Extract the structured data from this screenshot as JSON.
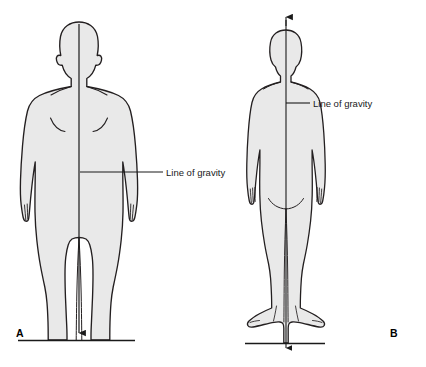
{
  "figure": {
    "background_color": "#ffffff",
    "body_fill_color": "#e9e9e9",
    "outline_color": "#231f20",
    "line_color": "#1a1a1a",
    "width": 426,
    "height": 367
  },
  "panels": [
    {
      "id": "A",
      "letter": "A",
      "view": "anterior",
      "annotation": {
        "label": "Line of gravity",
        "leader_start_x": 80,
        "leader_start_y": 172,
        "leader_end_x": 163,
        "text_x": 166,
        "text_y": 176
      },
      "gravity_line": {
        "x": 79,
        "top_y": 24,
        "bottom_y": 338,
        "arrow": "down"
      },
      "ground_line": {
        "y": 340,
        "x1": 18,
        "x2": 135
      },
      "letter_x": 16,
      "letter_y": 337
    },
    {
      "id": "B",
      "letter": "B",
      "view": "posterior",
      "annotation": {
        "label": "Line of gravity",
        "leader_start_x": 285,
        "leader_start_y": 103,
        "leader_end_x": 310,
        "text_x": 313,
        "text_y": 107
      },
      "gravity_line": {
        "x": 286,
        "top_y": 17,
        "bottom_y": 352,
        "arrow": "both"
      },
      "ground_line": {
        "y": 343,
        "x1": 245,
        "x2": 325
      },
      "letter_x": 390,
      "letter_y": 337
    }
  ],
  "icons": {
    "arrow_down": "arrow-down-icon",
    "arrow_up": "arrow-up-icon"
  }
}
